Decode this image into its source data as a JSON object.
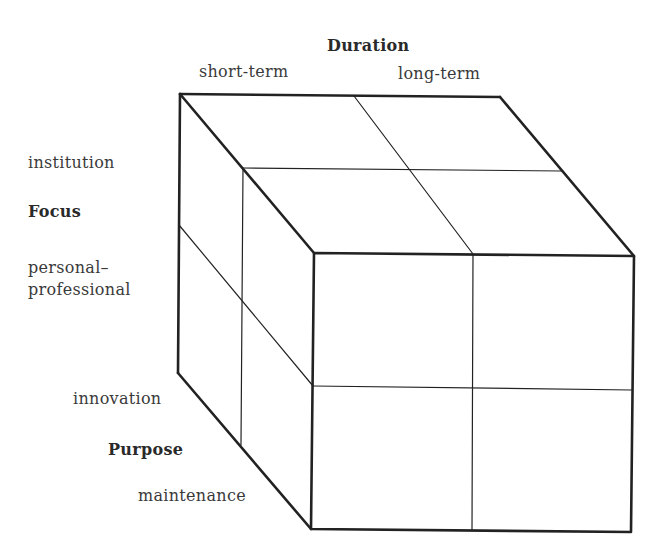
{
  "axes": {
    "duration": {
      "title": "Duration",
      "low": "short-term",
      "high": "long-term"
    },
    "focus": {
      "title": "Focus",
      "top": "institution",
      "bottom": "personal–professional",
      "bottom_line1": "personal–",
      "bottom_line2": "professional"
    },
    "purpose": {
      "title": "Purpose",
      "back": "innovation",
      "front": "maintenance"
    }
  },
  "cube": {
    "divisions": 2,
    "line_color": "#222222"
  }
}
